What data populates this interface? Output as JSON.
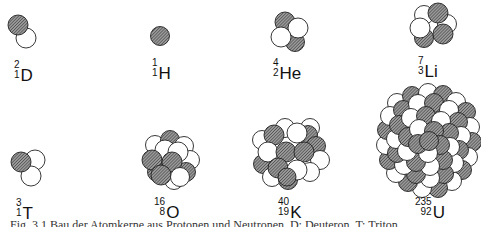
{
  "colors": {
    "proton_fill": "#6e6e6e",
    "neutron_fill": "#ffffff",
    "outline": "#222222",
    "background": "#ffffff"
  },
  "legend": {
    "hatched_circle": "proton",
    "white_circle": "neutron"
  },
  "nuclei": [
    {
      "id": "D",
      "mass": "2",
      "atomic": "1",
      "symbol": "D",
      "protons": 1,
      "neutrons": 1
    },
    {
      "id": "H",
      "mass": "1",
      "atomic": "1",
      "symbol": "H",
      "protons": 1,
      "neutrons": 0
    },
    {
      "id": "He",
      "mass": "4",
      "atomic": "2",
      "symbol": "He",
      "protons": 2,
      "neutrons": 2
    },
    {
      "id": "Li",
      "mass": "7",
      "atomic": "3",
      "symbol": "Li",
      "protons": 3,
      "neutrons": 4
    },
    {
      "id": "T",
      "mass": "3",
      "atomic": "1",
      "symbol": "T",
      "protons": 1,
      "neutrons": 2
    },
    {
      "id": "O",
      "mass": "16",
      "atomic": "8",
      "symbol": "O",
      "protons": 8,
      "neutrons": 8
    },
    {
      "id": "K",
      "mass": "40",
      "atomic": "19",
      "symbol": "K",
      "protons": 19,
      "neutrons": 21
    },
    {
      "id": "U",
      "mass": "235",
      "atomic": "92",
      "symbol": "U",
      "protons": 92,
      "neutrons": 143
    }
  ],
  "caption": "Fig. 3.1 Bau der Atomkerne aus Protonen und Neutronen. D: Deuteron, T: Triton"
}
